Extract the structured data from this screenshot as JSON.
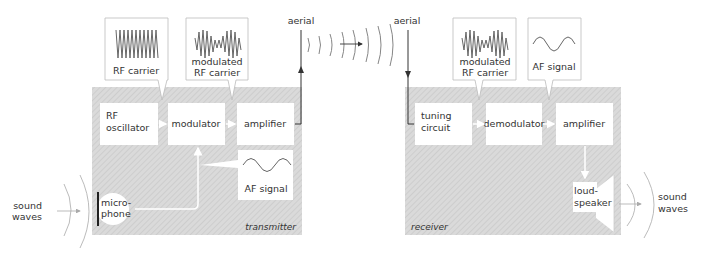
{
  "colors": {
    "panel_fill": "#d9d9d9",
    "hatch": "#c4c4c4",
    "box_fill": "#ffffff",
    "line": "#555555",
    "wave": "#666666",
    "arrow_light": "#ffffff"
  },
  "transmitter": {
    "label": "transmitter",
    "blocks": {
      "rf_oscillator": [
        "RF",
        "oscillator"
      ],
      "modulator": "modulator",
      "amplifier": "amplifier",
      "microphone": [
        "micro-",
        "phone"
      ]
    },
    "callouts": {
      "rf_carrier": "RF carrier",
      "modulated_rf_carrier": [
        "modulated",
        "RF carrier"
      ],
      "af_signal": "AF signal"
    },
    "aerial_label": "aerial",
    "sound_waves": [
      "sound",
      "waves"
    ]
  },
  "receiver": {
    "label": "receiver",
    "blocks": {
      "tuning_circuit": [
        "tuning",
        "circuit"
      ],
      "demodulator": "demodulator",
      "amplifier": "amplifier",
      "loudspeaker": [
        "loud-",
        "speaker"
      ]
    },
    "callouts": {
      "modulated_rf_carrier": [
        "modulated",
        "RF carrier"
      ],
      "af_signal": "AF signal"
    },
    "aerial_label": "aerial",
    "sound_waves": [
      "sound",
      "waves"
    ]
  }
}
